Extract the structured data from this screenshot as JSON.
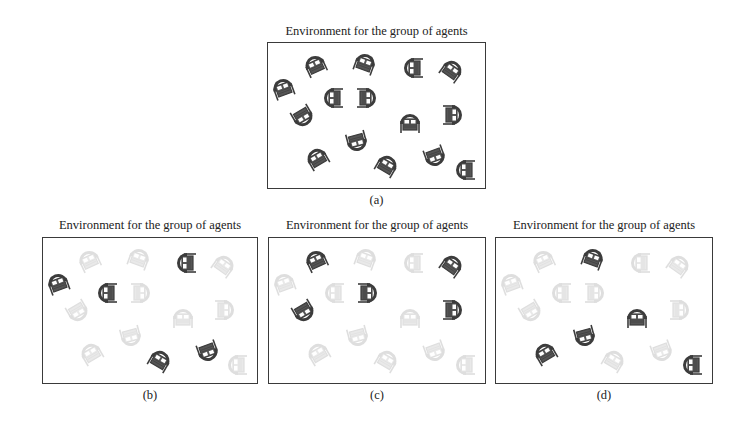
{
  "figure": {
    "panels": [
      {
        "id": "a",
        "title": "Environment for the group of agents",
        "caption": "(a)",
        "box": {
          "x": 267,
          "y": 42,
          "w": 219,
          "h": 147
        },
        "title_y": 24,
        "caption_y": 193,
        "active": [
          1,
          2,
          3,
          4,
          5,
          6,
          7,
          8,
          9,
          10,
          11,
          12,
          13,
          14,
          15
        ]
      },
      {
        "id": "b",
        "title": "Environment for the group of agents",
        "caption": "(b)",
        "box": {
          "x": 42,
          "y": 237,
          "w": 216,
          "h": 147
        },
        "title_y": 218,
        "caption_y": 388,
        "active": [
          3,
          5,
          6,
          13,
          14
        ]
      },
      {
        "id": "c",
        "title": "Environment for the group of agents",
        "caption": "(c)",
        "box": {
          "x": 268,
          "y": 237,
          "w": 218,
          "h": 147
        },
        "title_y": 218,
        "caption_y": 388,
        "active": [
          1,
          4,
          7,
          8,
          10
        ]
      },
      {
        "id": "d",
        "title": "Environment for the group of agents",
        "caption": "(d)",
        "box": {
          "x": 495,
          "y": 237,
          "w": 218,
          "h": 147
        },
        "title_y": 218,
        "caption_y": 388,
        "active": [
          2,
          9,
          11,
          12,
          15
        ]
      }
    ],
    "agents": [
      {
        "id": 1,
        "x": 48,
        "y": 23,
        "rot": -25
      },
      {
        "id": 2,
        "x": 98,
        "y": 21,
        "rot": 20
      },
      {
        "id": 3,
        "x": 146,
        "y": 26,
        "rot": -90
      },
      {
        "id": 4,
        "x": 185,
        "y": 28,
        "rot": 35
      },
      {
        "id": 5,
        "x": 16,
        "y": 46,
        "rot": -20
      },
      {
        "id": 6,
        "x": 66,
        "y": 56,
        "rot": -90
      },
      {
        "id": 7,
        "x": 100,
        "y": 56,
        "rot": 90
      },
      {
        "id": 8,
        "x": 36,
        "y": 75,
        "rot": 150
      },
      {
        "id": 9,
        "x": 143,
        "y": 81,
        "rot": 0
      },
      {
        "id": 10,
        "x": 186,
        "y": 73,
        "rot": 90
      },
      {
        "id": 11,
        "x": 90,
        "y": 100,
        "rot": 165
      },
      {
        "id": 12,
        "x": 50,
        "y": 116,
        "rot": -30
      },
      {
        "id": 13,
        "x": 120,
        "y": 123,
        "rot": 30
      },
      {
        "id": 14,
        "x": 168,
        "y": 115,
        "rot": 160
      },
      {
        "id": 15,
        "x": 198,
        "y": 128,
        "rot": -90
      }
    ],
    "colors": {
      "active_fill": "#3c3c3c",
      "active_body": "#555555",
      "inactive_fill": "#d4d4d4",
      "inactive_body": "#e2e2e2",
      "border": "#3a3a3a"
    }
  }
}
